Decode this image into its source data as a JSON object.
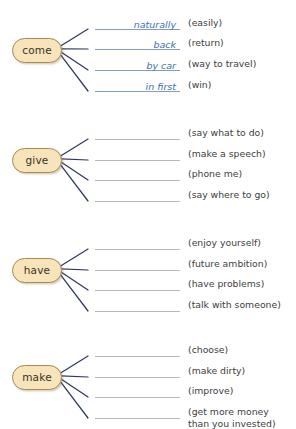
{
  "page": {
    "background_color": "#ffffff",
    "node_fill_color": "#f7e4ba",
    "node_border_color": "#a98a4e",
    "connector_color": "#2c3a63",
    "answer_text_color": "#3b6fb0",
    "empty_rule_color": "#b9b9b9",
    "filled_rule_color": "#7d9dc4",
    "hint_text_color": "#3d3d3d"
  },
  "groups": [
    {
      "verb": "come",
      "node_top": 38,
      "rows": [
        {
          "answer": "naturally",
          "hint": "(easily)",
          "y": 16
        },
        {
          "answer": "back",
          "hint": "(return)",
          "y": 36
        },
        {
          "answer": "by car",
          "hint": "(way to travel)",
          "y": 57
        },
        {
          "answer": "in first",
          "hint": "(win)",
          "y": 78
        }
      ]
    },
    {
      "verb": "give",
      "node_top": 148,
      "rows": [
        {
          "answer": "",
          "hint": "(say what to do)",
          "y": 126
        },
        {
          "answer": "",
          "hint": "(make a speech)",
          "y": 147
        },
        {
          "answer": "",
          "hint": "(phone me)",
          "y": 167
        },
        {
          "answer": "",
          "hint": "(say where to go)",
          "y": 188
        }
      ]
    },
    {
      "verb": "have",
      "node_top": 258,
      "rows": [
        {
          "answer": "",
          "hint": "(enjoy yourself)",
          "y": 236
        },
        {
          "answer": "",
          "hint": "(future ambition)",
          "y": 257
        },
        {
          "answer": "",
          "hint": "(have problems)",
          "y": 277
        },
        {
          "answer": "",
          "hint": "(talk with someone)",
          "y": 298
        }
      ]
    },
    {
      "verb": "make",
      "node_top": 365,
      "rows": [
        {
          "answer": "",
          "hint": "(choose)",
          "y": 343
        },
        {
          "answer": "",
          "hint": "(make dirty)",
          "y": 364
        },
        {
          "answer": "",
          "hint": "(improve)",
          "y": 384
        },
        {
          "answer": "",
          "hint": "(get more money\nthan you invested)",
          "y": 405
        }
      ]
    }
  ]
}
